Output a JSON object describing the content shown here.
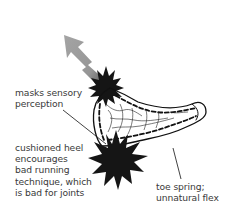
{
  "diagram": {
    "colors": {
      "ink": "#111111",
      "label_text": "#3a3a3a",
      "arrow": "#9a9a9a",
      "background": "#ffffff"
    },
    "annotations": [
      {
        "id": "mask",
        "text": "masks sensory\nperception",
        "icon": "starburst-icon"
      },
      {
        "id": "heel",
        "text": "cushioned heel\nencourages\nbad running\ntechnique, which\nis bad for joints",
        "icon": "starburst-icon"
      },
      {
        "id": "toe",
        "text": "toe spring;\nunnatural flex"
      }
    ],
    "arrow": {
      "direction": "up-left",
      "meaning": "sensory signal blocked"
    }
  }
}
